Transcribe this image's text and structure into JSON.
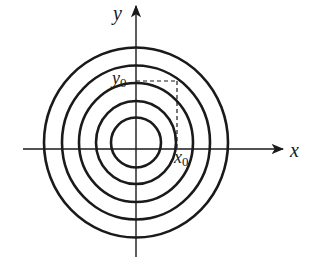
{
  "diagram": {
    "type": "concentric-circles-on-axes",
    "axes": {
      "x_label": "x",
      "y_label": "y",
      "origin": [
        136,
        149
      ],
      "x_range_px": [
        23,
        283
      ],
      "y_range_px": [
        6,
        257
      ]
    },
    "circles": {
      "center": [
        136,
        142.5
      ],
      "count": 5,
      "radii_x": [
        92,
        74,
        57,
        40,
        25
      ],
      "radii_y": [
        95,
        77,
        59.5,
        41.5,
        25
      ],
      "stroke": "#1a1a1a"
    },
    "marked_point": {
      "x_label_main": "x",
      "x_label_sub": "0",
      "y_label_main": "y",
      "y_label_sub": "0",
      "corner_px": [
        177,
        81
      ],
      "line_style": "dashed"
    },
    "colors": {
      "line": "#1a1a1a",
      "background": "#ffffff"
    }
  }
}
